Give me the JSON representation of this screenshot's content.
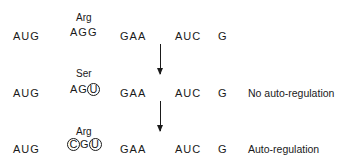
{
  "rows": [
    {
      "amino_acid": "Arg",
      "codons": [
        "AUG",
        "AGG",
        "GAA",
        "AUC",
        "G"
      ],
      "label": ""
    },
    {
      "amino_acid": "Ser",
      "codons": [
        "AUG",
        "AG",
        "GAA",
        "AUC",
        "G"
      ],
      "circled": [
        "U"
      ],
      "label": "No auto-regulation"
    },
    {
      "amino_acid": "Arg",
      "codons": [
        "AUG",
        "G",
        "GAA",
        "AUC",
        "G"
      ],
      "circled": [
        "C",
        "U"
      ],
      "label": "Auto-regulation"
    }
  ],
  "arrows": [
    "down-arrow",
    "down-arrow"
  ]
}
